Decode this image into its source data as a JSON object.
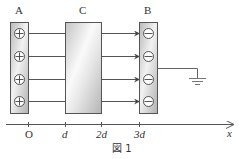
{
  "labels": {
    "plate_a": "A",
    "box_c": "C",
    "plate_b": "B"
  },
  "plate_a": {
    "charge_symbols": [
      "⊕",
      "⊕",
      "⊕",
      "⊕"
    ],
    "charge": "positive"
  },
  "plate_b": {
    "charge_symbols": [
      "⊖",
      "⊖",
      "⊖",
      "⊖"
    ],
    "charge": "negative",
    "grounded": true
  },
  "axis": {
    "ticks": [
      {
        "label": "O",
        "italic": false
      },
      {
        "label": "d",
        "italic": true
      },
      {
        "label": "2d",
        "italic": true
      },
      {
        "label": "3d",
        "italic": true
      }
    ],
    "axis_label": "x"
  },
  "caption": "図 1",
  "colors": {
    "plate_fill": "#c8c8c8",
    "line": "#555555",
    "background": "#ffffff"
  }
}
